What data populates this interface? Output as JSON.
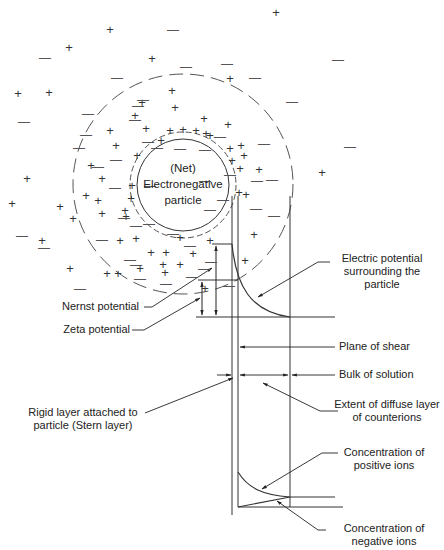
{
  "diagram": {
    "particle_label": [
      "(Net)",
      "Electronegative",
      "particle"
    ],
    "labels": {
      "electric_potential": [
        "Electric potential",
        "surrounding the",
        "particle"
      ],
      "nernst_potential": "Nernst potential",
      "zeta_potential": "Zeta potential",
      "plane_of_shear": "Plane of shear",
      "bulk_of_solution": "Bulk of solution",
      "rigid_layer": [
        "Rigid layer attached to",
        "particle  (Stern layer)"
      ],
      "diffuse_layer": [
        "Extent of diffuse layer",
        "of counterions"
      ],
      "positive_ions": [
        "Concentration of",
        "positive ions"
      ],
      "negative_ions": [
        "Concentration of",
        "negative ions"
      ]
    },
    "symbols": {
      "plus": "+",
      "minus": "—"
    },
    "colors": {
      "line": "#333333",
      "dashed": "#555555",
      "text": "#222222"
    }
  }
}
